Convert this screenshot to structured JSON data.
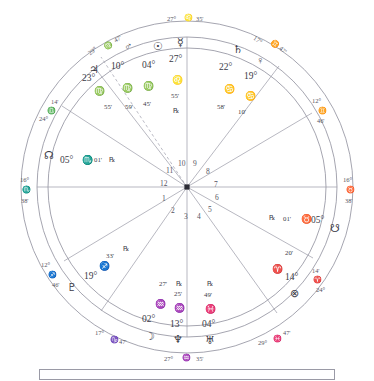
{
  "chart": {
    "type": "astrological-natal-wheel",
    "title": "",
    "center_marker": "center-dot",
    "house_numbers": [
      "1",
      "2",
      "3",
      "4",
      "5",
      "6",
      "7",
      "8",
      "9",
      "10",
      "11",
      "12"
    ],
    "signs": {
      "aries": "♈",
      "taurus": "♉",
      "gemini": "♊",
      "cancer": "♋",
      "leo": "♌",
      "virgo": "♍",
      "libra": "♎",
      "scorpio": "♏",
      "sagittarius": "♐",
      "capricorn": "♑",
      "aquarius": "♒",
      "pisces": "♓"
    },
    "cusps": [
      {
        "id": "cusp-mc",
        "deg": "27°",
        "sign": "♌",
        "min": "35'",
        "sign_name": "leo",
        "position": "top-center"
      },
      {
        "id": "cusp-11",
        "deg": "29°",
        "sign": "♍",
        "min": "47'",
        "sign_name": "virgo",
        "position": "upper-left"
      },
      {
        "id": "cusp-12",
        "deg": "24°",
        "sign": "♎",
        "min": "14'",
        "sign_name": "libra",
        "position": "left-upper"
      },
      {
        "id": "cusp-asc",
        "deg": "16°",
        "sign": "♏",
        "min": "38'",
        "sign_name": "scorpio",
        "position": "left-center"
      },
      {
        "id": "cusp-2",
        "deg": "12°",
        "sign": "♐",
        "min": "46'",
        "sign_name": "sagittarius",
        "position": "left-lower"
      },
      {
        "id": "cusp-3",
        "deg": "17°",
        "sign": "♑",
        "min": "47'",
        "sign_name": "capricorn",
        "position": "lower-left"
      },
      {
        "id": "cusp-ic",
        "deg": "27°",
        "sign": "♒",
        "min": "35'",
        "sign_name": "aquarius",
        "position": "bottom-center"
      },
      {
        "id": "cusp-5",
        "deg": "29°",
        "sign": "♓",
        "min": "47'",
        "sign_name": "pisces",
        "position": "lower-right"
      },
      {
        "id": "cusp-6",
        "deg": "24°",
        "sign": "♈",
        "min": "14'",
        "sign_name": "aries",
        "position": "right-lower"
      },
      {
        "id": "cusp-dsc",
        "deg": "16°",
        "sign": "♉",
        "min": "38'",
        "sign_name": "taurus",
        "position": "right-center"
      },
      {
        "id": "cusp-8",
        "deg": "12°",
        "sign": "♊",
        "min": "46'",
        "sign_name": "gemini",
        "position": "right-upper"
      },
      {
        "id": "cusp-9",
        "deg": "17°",
        "sign": "♊",
        "min": "47'",
        "sign_name": "gemini",
        "position": "upper-right"
      }
    ],
    "planets": [
      {
        "id": "jupiter",
        "name": "Jupiter",
        "glyph": "♃",
        "deg": "23°",
        "sign": "♍",
        "sign_name": "virgo",
        "min": "55'",
        "retrograde": ""
      },
      {
        "id": "mars",
        "name": "Mars",
        "glyph": "♂",
        "deg": "10°",
        "sign": "♍",
        "sign_name": "virgo",
        "min": "59'",
        "retrograde": ""
      },
      {
        "id": "sun",
        "name": "Sun",
        "glyph": "☉",
        "deg": "04°",
        "sign": "♍",
        "sign_name": "virgo",
        "min": "45'",
        "retrograde": ""
      },
      {
        "id": "mercury",
        "name": "Mercury",
        "glyph": "☿",
        "deg": "27°",
        "sign": "♌",
        "sign_name": "leo",
        "min": "55'",
        "retrograde": "℞"
      },
      {
        "id": "saturn",
        "name": "Saturn",
        "glyph": "♄",
        "deg": "22°",
        "sign": "♋",
        "sign_name": "cancer",
        "min": "58'",
        "retrograde": ""
      },
      {
        "id": "venus",
        "name": "Venus",
        "glyph": "♀",
        "deg": "19°",
        "sign": "♋",
        "sign_name": "cancer",
        "min": "10'",
        "retrograde": ""
      },
      {
        "id": "southnode",
        "name": "South Node",
        "glyph": "☋",
        "deg": "05°",
        "sign": "♉",
        "sign_name": "taurus",
        "min": "01'",
        "retrograde": "℞"
      },
      {
        "id": "fortune",
        "name": "Part of Fortune",
        "glyph": "⊗",
        "deg": "14°",
        "sign": "♈",
        "sign_name": "aries",
        "min": "20'",
        "retrograde": ""
      },
      {
        "id": "uranus",
        "name": "Uranus",
        "glyph": "♅",
        "deg": "04°",
        "sign": "♓",
        "sign_name": "pisces",
        "min": "49'",
        "retrograde": "℞"
      },
      {
        "id": "neptune",
        "name": "Neptune",
        "glyph": "♆",
        "deg": "13°",
        "sign": "♒",
        "sign_name": "aquarius",
        "min": "25'",
        "retrograde": ""
      },
      {
        "id": "moon",
        "name": "Moon",
        "glyph": "☽",
        "deg": "02°",
        "sign": "♒",
        "sign_name": "aquarius",
        "min": "27'",
        "retrograde": "℞"
      },
      {
        "id": "pluto",
        "name": "Pluto",
        "glyph": "♇",
        "deg": "19°",
        "sign": "♐",
        "sign_name": "sagittarius",
        "min": "33'",
        "retrograde": "℞"
      },
      {
        "id": "northnode",
        "name": "North Node",
        "glyph": "☊",
        "deg": "05°",
        "sign": "♏",
        "sign_name": "scorpio",
        "min": "01'",
        "retrograde": "℞"
      }
    ],
    "colors": {
      "stroke": "#8e8e9c",
      "text": "#3a3a46",
      "muted": "#55555f",
      "background": "#ffffff"
    }
  }
}
